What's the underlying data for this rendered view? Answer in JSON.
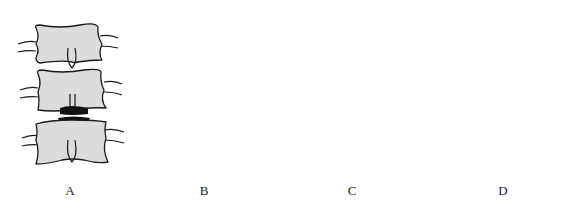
{
  "figure": {
    "panels": [
      {
        "id": "A",
        "label": "A",
        "view": "anterior",
        "description": "Three vertebral bodies, front view, with disc herniation between middle and lower vertebra"
      },
      {
        "id": "B",
        "label": "B",
        "view": "lateral",
        "description": "Three vertebrae, side view, with disc lesion between middle and lower vertebra"
      },
      {
        "id": "C",
        "label": "C",
        "view": "anterior",
        "description": "Three vertebral bodies, front view, with extruded disc fragments at lower level"
      },
      {
        "id": "D",
        "label": "D",
        "view": "lateral",
        "description": "Three vertebrae, side view, with posterior disc protrusion"
      }
    ],
    "colors": {
      "bone_fill": "#dcdcdc",
      "outline": "#1a1a1a",
      "disc": "#111111",
      "background": "#ffffff"
    }
  }
}
